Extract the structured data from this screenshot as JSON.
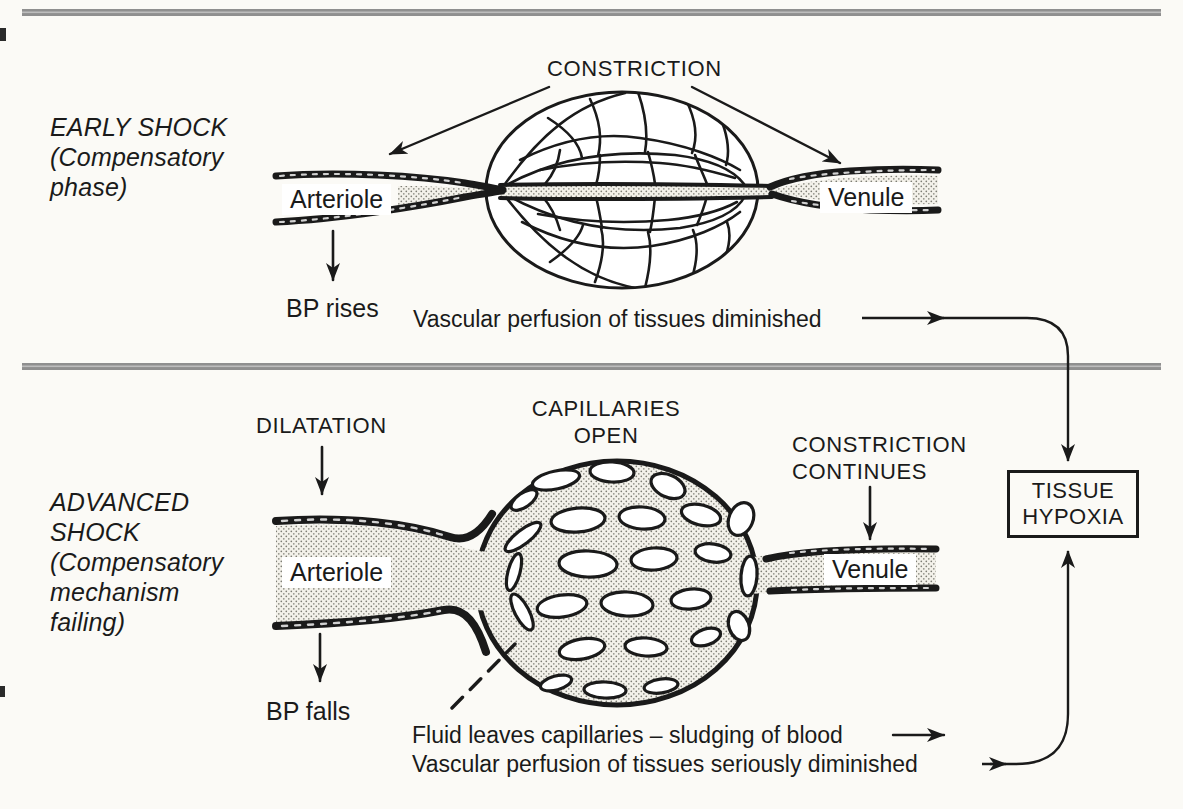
{
  "colors": {
    "ink": "#1a1a1a",
    "paper": "#fbfaf6",
    "divider": "#8f8f8f",
    "stipple_dot": "#7d7d74"
  },
  "early": {
    "heading": "EARLY SHOCK\n(Compensatory\nphase)",
    "constriction": "CONSTRICTION",
    "arteriole": "Arteriole",
    "venule": "Venule",
    "bp": "BP rises",
    "perfusion": "Vascular perfusion of tissues diminished"
  },
  "advanced": {
    "heading": "ADVANCED\nSHOCK\n(Compensatory\nmechanism\nfailing)",
    "dilatation": "DILATATION",
    "capillaries": "CAPILLARIES\nOPEN",
    "constriction": "CONSTRICTION\nCONTINUES",
    "arteriole": "Arteriole",
    "venule": "Venule",
    "bp": "BP falls",
    "fluid": "Fluid leaves capillaries – sludging of blood",
    "perfusion": "Vascular perfusion of tissues seriously diminished"
  },
  "outcome": {
    "box": "TISSUE\nHYPOXIA"
  }
}
